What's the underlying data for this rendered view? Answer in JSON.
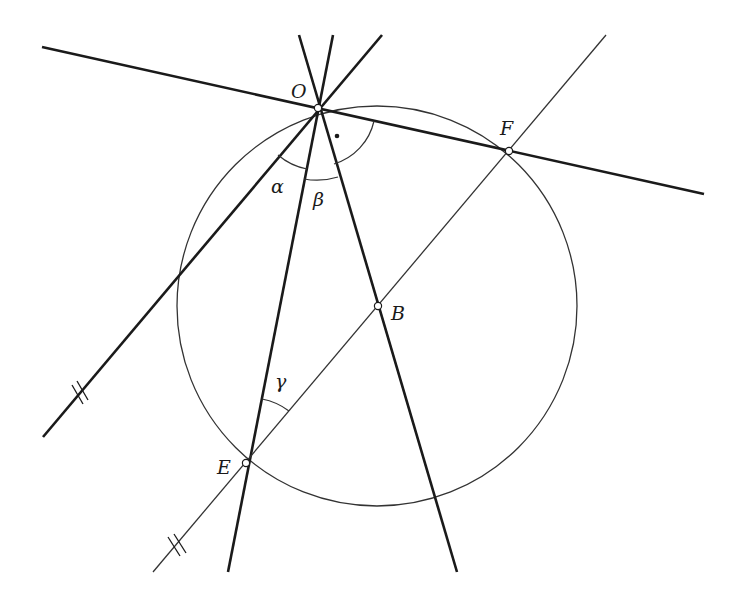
{
  "diagram": {
    "title": "",
    "colors": {
      "background": "#ffffff",
      "stroke": "#1a1a1a",
      "thin_stroke": "#333333",
      "point_fill": "#ffffff"
    },
    "circle": {
      "cx": 377,
      "cy": 306,
      "r": 200
    },
    "points": [
      {
        "id": "O",
        "label": "O",
        "x": 318,
        "y": 108,
        "lx": 291,
        "ly": 98
      },
      {
        "id": "F",
        "label": "F",
        "x": 509,
        "y": 151,
        "lx": 500,
        "ly": 135
      },
      {
        "id": "B",
        "label": "B",
        "x": 378,
        "y": 306,
        "lx": 392,
        "ly": 320
      },
      {
        "id": "E",
        "label": "E",
        "x": 246,
        "y": 463,
        "lx": 218,
        "ly": 474
      }
    ],
    "lines": [
      {
        "id": "tangent-line-OF",
        "x1": 42,
        "y1": 47,
        "x2": 704,
        "y2": 194,
        "weight": "thick"
      },
      {
        "id": "line-alpha",
        "x1": 43,
        "y1": 437,
        "x2": 382,
        "y2": 35,
        "weight": "thick"
      },
      {
        "id": "line-OE",
        "x1": 333,
        "y1": 35,
        "x2": 228,
        "y2": 572,
        "weight": "thick"
      },
      {
        "id": "line-OB",
        "x1": 299,
        "y1": 35,
        "x2": 457,
        "y2": 572,
        "weight": "thick"
      },
      {
        "id": "line-EF",
        "x1": 153,
        "y1": 572,
        "x2": 606,
        "y2": 35,
        "weight": "thin"
      }
    ],
    "angles": [
      {
        "id": "alpha",
        "label": "α",
        "lx": 271,
        "ly": 193
      },
      {
        "id": "beta",
        "label": "β",
        "lx": 313,
        "ly": 205
      },
      {
        "id": "gamma",
        "label": "γ",
        "lx": 275,
        "ly": 389
      },
      {
        "id": "right-angle-dot",
        "label": "•"
      }
    ],
    "parallel_marks": [
      {
        "id": "parallel-mark-1",
        "x": 78,
        "y": 394
      },
      {
        "id": "parallel-mark-2",
        "x": 175,
        "y": 546
      }
    ]
  }
}
